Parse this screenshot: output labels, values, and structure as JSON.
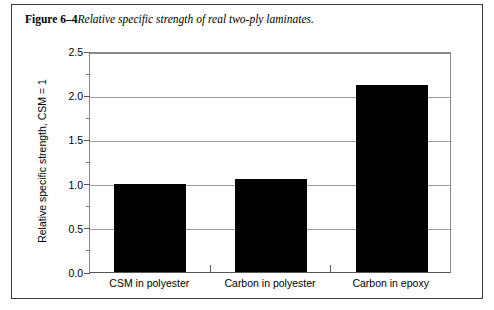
{
  "figure": {
    "label": "Figure 6–4",
    "caption": "Relative specific strength of real two-ply laminates."
  },
  "chart_data": {
    "type": "bar",
    "title": "",
    "categories": [
      "CSM in polyester",
      "Carbon in polyester",
      "Carbon in epoxy"
    ],
    "values": [
      1.0,
      1.05,
      2.12
    ],
    "xlabel": "",
    "ylabel": "Relative specific strength, CSM = 1",
    "ylim": [
      0.0,
      2.5
    ],
    "ytick_labels": [
      "0.0",
      "0.5",
      "1.0",
      "1.5",
      "2.0",
      "2.5"
    ],
    "ytick_values": [
      0.0,
      0.5,
      1.0,
      1.5,
      2.0,
      2.5
    ],
    "yminor_tick_values": [
      0.25,
      0.75,
      1.25,
      1.75,
      2.25
    ],
    "grid": true,
    "grid_axis": "y",
    "legend": false,
    "bar_color": "#000000",
    "grid_color": "#9a9a9a",
    "axis_color": "#555555"
  }
}
